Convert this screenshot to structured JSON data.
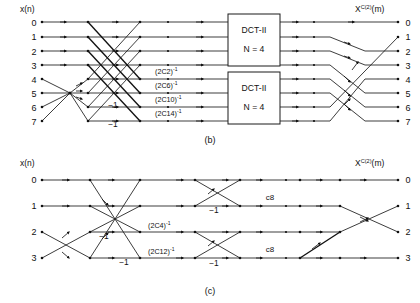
{
  "figure": {
    "caption_b": "(b)",
    "caption_c": "(c)",
    "input_label": "x(n)",
    "output_label_base": "X",
    "output_label_sup": "C(2)",
    "output_label_arg": "(m)"
  },
  "diagram_b": {
    "name": "8-point DCT-II signal flow graph",
    "input_label": "x(n)",
    "output_label": "X^C(2)(m)",
    "input_indices": [
      "0",
      "1",
      "2",
      "3",
      "4",
      "5",
      "6",
      "7"
    ],
    "output_indices": [
      "0",
      "1",
      "2",
      "3",
      "4",
      "5",
      "6",
      "7"
    ],
    "blocks": [
      {
        "title": "DCT-II",
        "subtitle": "N = 4"
      },
      {
        "title": "DCT-II",
        "subtitle": "N = 4"
      }
    ],
    "coefficients": [
      {
        "text": "(2C2)",
        "sup": "-1"
      },
      {
        "text": "(2C6)",
        "sup": "-1"
      },
      {
        "text": "(2C10)",
        "sup": "-1"
      },
      {
        "text": "(2C14)",
        "sup": "-1"
      }
    ],
    "minus_ones": [
      "−1",
      "−1"
    ]
  },
  "diagram_c": {
    "name": "4-point DCT-II signal flow graph",
    "input_label": "x(n)",
    "output_label": "X^C(2)(m)",
    "input_indices": [
      "0",
      "1",
      "2",
      "3"
    ],
    "output_indices": [
      "0",
      "1",
      "2",
      "3"
    ],
    "coefficients": [
      {
        "text": "(2C4)",
        "sup": "-1"
      },
      {
        "text": "(2C12)",
        "sup": "-1"
      }
    ],
    "minus_ones": [
      "−1",
      "−1",
      "−1",
      "−1"
    ],
    "c8_labels": [
      "c8",
      "c8"
    ]
  },
  "colors": {
    "line": "#1a1a1a",
    "text": "#111111",
    "background": "#ffffff"
  }
}
